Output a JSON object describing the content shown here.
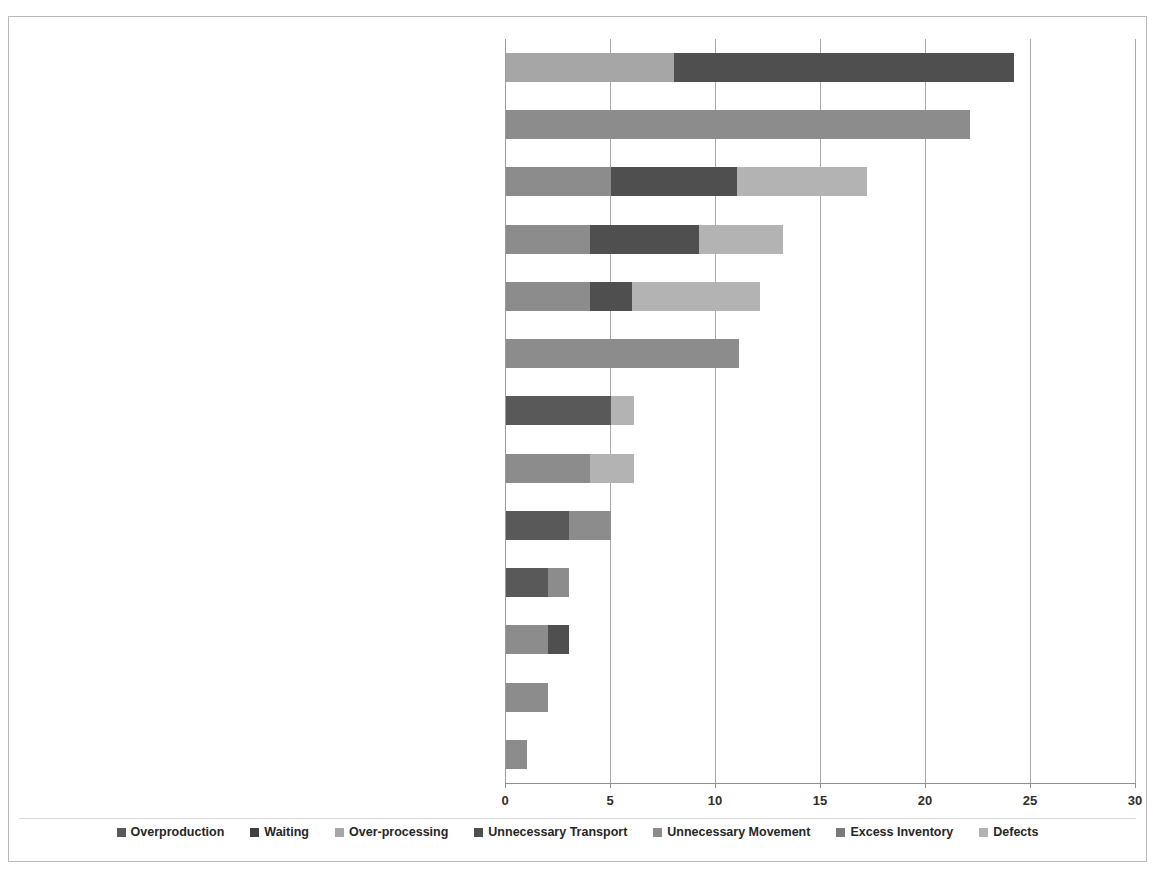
{
  "title": "",
  "chart_data": {
    "type": "bar",
    "orientation": "horizontal",
    "stacked": true,
    "title": "",
    "xlabel": "",
    "ylabel": "",
    "xlim": [
      0,
      30
    ],
    "xticks": [
      0,
      5,
      10,
      15,
      20,
      25,
      30
    ],
    "xtick_labels": [
      "0",
      "5",
      "10",
      "15",
      "20",
      "25",
      "30"
    ],
    "grid": true,
    "legend_position": "bottom",
    "categories": [
      "Process design",
      "Facility layout and restricted boundaries which could not be avoided",
      "Poor planning / forecast accuracy",
      "Low reliability/flexibility of production lines",
      "Nature of the business/market",
      "Reliability of raw materials suppliers",
      "Poor staff skills / no multi-tasking",
      "Limited capacity vs. peak demand",
      "Mindset / resistance to change",
      "Related to regional issues",
      "Organisation structure",
      "Lack of real-time information",
      "Lack of real-time information"
    ],
    "series": [
      {
        "name": "Overproduction",
        "color": "#595959",
        "values": [
          0,
          0,
          0,
          0,
          0,
          0,
          5,
          0,
          3,
          2,
          0,
          0,
          0
        ]
      },
      {
        "name": "Waiting",
        "color": "#404040",
        "values": [
          0,
          0,
          0,
          0,
          0,
          0,
          0,
          0,
          0,
          0,
          0,
          0,
          0
        ]
      },
      {
        "name": "Over-processing",
        "color": "#a6a6a6",
        "values": [
          8,
          0,
          0,
          0,
          0,
          0,
          0,
          0,
          0,
          0,
          0,
          0,
          0
        ]
      },
      {
        "name": "Unnecessary Transport",
        "color": "#4f4f4f",
        "values": [
          16.2,
          0,
          6,
          5.2,
          2,
          0,
          0,
          0,
          0,
          0,
          1,
          0,
          0
        ]
      },
      {
        "name": "Unnecessary Movement",
        "color": "#8c8c8c",
        "values": [
          0,
          22.1,
          5,
          4,
          4,
          11.1,
          0,
          4,
          2,
          1,
          2,
          2,
          1
        ]
      },
      {
        "name": "Excess Inventory",
        "color": "#7a7a7a",
        "values": [
          0,
          0,
          0,
          0,
          0,
          0,
          0,
          0,
          0,
          0,
          0,
          0,
          0
        ]
      },
      {
        "name": "Defects",
        "color": "#b3b3b3",
        "values": [
          0,
          0,
          6.2,
          4,
          6.1,
          0,
          1.1,
          2.1,
          0,
          0,
          0,
          0,
          0
        ]
      }
    ],
    "bar_totals": [
      24.2,
      22.1,
      17.2,
      13.2,
      12.1,
      11.1,
      6.1,
      6.1,
      5.0,
      3.0,
      3.0,
      2.0,
      1.0
    ],
    "stack_order_per_bar": [
      [
        {
          "series": "Over-processing",
          "value": 8
        },
        {
          "series": "Unnecessary Transport",
          "value": 16.2
        }
      ],
      [
        {
          "series": "Unnecessary Movement",
          "value": 22.1
        }
      ],
      [
        {
          "series": "Unnecessary Movement",
          "value": 5
        },
        {
          "series": "Unnecessary Transport",
          "value": 6
        },
        {
          "series": "Defects",
          "value": 6.2
        }
      ],
      [
        {
          "series": "Unnecessary Movement",
          "value": 4
        },
        {
          "series": "Unnecessary Transport",
          "value": 5.2
        },
        {
          "series": "Defects",
          "value": 4
        }
      ],
      [
        {
          "series": "Unnecessary Movement",
          "value": 4
        },
        {
          "series": "Unnecessary Transport",
          "value": 2
        },
        {
          "series": "Defects",
          "value": 6.1
        }
      ],
      [
        {
          "series": "Unnecessary Movement",
          "value": 11.1
        }
      ],
      [
        {
          "series": "Overproduction",
          "value": 5
        },
        {
          "series": "Defects",
          "value": 1.1
        }
      ],
      [
        {
          "series": "Unnecessary Movement",
          "value": 4
        },
        {
          "series": "Defects",
          "value": 2.1
        }
      ],
      [
        {
          "series": "Overproduction",
          "value": 3
        },
        {
          "series": "Unnecessary Movement",
          "value": 2
        }
      ],
      [
        {
          "series": "Overproduction",
          "value": 2
        },
        {
          "series": "Unnecessary Movement",
          "value": 1
        }
      ],
      [
        {
          "series": "Unnecessary Movement",
          "value": 2
        },
        {
          "series": "Unnecessary Transport",
          "value": 1
        }
      ],
      [
        {
          "series": "Unnecessary Movement",
          "value": 2
        }
      ],
      [
        {
          "series": "Unnecessary Movement",
          "value": 1
        }
      ]
    ]
  },
  "legend": {
    "items": [
      {
        "label": "Overproduction",
        "color": "#595959"
      },
      {
        "label": "Waiting",
        "color": "#404040"
      },
      {
        "label": "Over-processing",
        "color": "#a6a6a6"
      },
      {
        "label": "Unnecessary Transport",
        "color": "#4f4f4f"
      },
      {
        "label": "Unnecessary Movement",
        "color": "#8c8c8c"
      },
      {
        "label": "Excess Inventory",
        "color": "#7a7a7a"
      },
      {
        "label": "Defects",
        "color": "#b3b3b3"
      }
    ]
  },
  "style": {
    "grid_color": "#a9a9a9",
    "axis_color": "#8f8f8f",
    "frame_color": "#b9b9b9",
    "text_color": "#262626",
    "background": "#ffffff"
  }
}
